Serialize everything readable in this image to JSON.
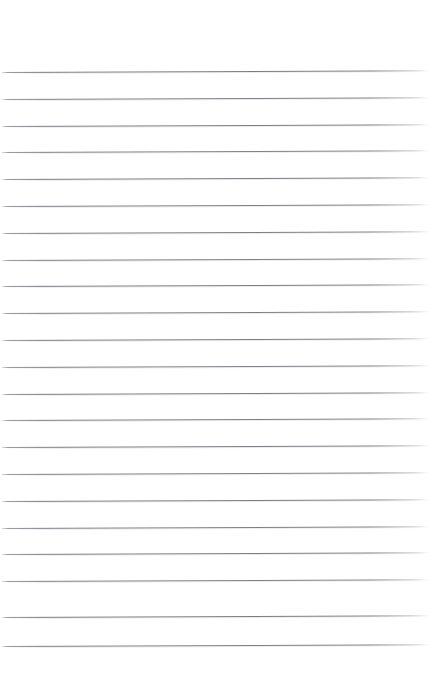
{
  "document": {
    "kind": "scanned-lined-paper",
    "title": "Blank Lined Notebook Page",
    "page_width": 438,
    "page_height": 688,
    "paper_color": "#ffffff",
    "rule_color": "#686a70",
    "written_text": "",
    "header_text": "",
    "footer_text": "",
    "page_number": "",
    "margin_rule": "none",
    "top_margin_px": 72,
    "bottom_margin_px": 41,
    "left_inset_px": 2,
    "right_inset_px": 7,
    "line_spacing_px": 26.8,
    "line_count": 22,
    "slant_deg": -0.22
  },
  "rules": [
    {
      "index": 1,
      "y": 72.0,
      "left": 2,
      "width": 429,
      "opacity": 0.95
    },
    {
      "index": 2,
      "y": 98.8,
      "left": 2,
      "width": 429,
      "opacity": 0.93
    },
    {
      "index": 3,
      "y": 125.6,
      "left": 2,
      "width": 429,
      "opacity": 0.94
    },
    {
      "index": 4,
      "y": 152.4,
      "left": 2,
      "width": 429,
      "opacity": 0.92
    },
    {
      "index": 5,
      "y": 179.2,
      "left": 2,
      "width": 429,
      "opacity": 0.95
    },
    {
      "index": 6,
      "y": 206.0,
      "left": 2,
      "width": 429,
      "opacity": 0.93
    },
    {
      "index": 7,
      "y": 232.8,
      "left": 2,
      "width": 429,
      "opacity": 0.94
    },
    {
      "index": 8,
      "y": 259.6,
      "left": 2,
      "width": 429,
      "opacity": 0.92
    },
    {
      "index": 9,
      "y": 286.4,
      "left": 2,
      "width": 429,
      "opacity": 0.95
    },
    {
      "index": 10,
      "y": 313.2,
      "left": 2,
      "width": 429,
      "opacity": 0.93
    },
    {
      "index": 11,
      "y": 340.0,
      "left": 2,
      "width": 429,
      "opacity": 0.94
    },
    {
      "index": 12,
      "y": 366.8,
      "left": 2,
      "width": 429,
      "opacity": 0.92
    },
    {
      "index": 13,
      "y": 393.6,
      "left": 2,
      "width": 429,
      "opacity": 0.95
    },
    {
      "index": 14,
      "y": 420.4,
      "left": 2,
      "width": 429,
      "opacity": 0.93
    },
    {
      "index": 15,
      "y": 447.2,
      "left": 2,
      "width": 429,
      "opacity": 0.94
    },
    {
      "index": 16,
      "y": 474.0,
      "left": 2,
      "width": 429,
      "opacity": 0.92
    },
    {
      "index": 17,
      "y": 500.8,
      "left": 2,
      "width": 429,
      "opacity": 0.95
    },
    {
      "index": 18,
      "y": 527.6,
      "left": 2,
      "width": 429,
      "opacity": 0.93
    },
    {
      "index": 19,
      "y": 554.4,
      "left": 2,
      "width": 429,
      "opacity": 0.94
    },
    {
      "index": 20,
      "y": 581.2,
      "left": 2,
      "width": 429,
      "opacity": 0.92
    },
    {
      "index": 21,
      "y": 617.0,
      "left": 2,
      "width": 429,
      "opacity": 0.95
    },
    {
      "index": 22,
      "y": 646.0,
      "left": 2,
      "width": 429,
      "opacity": 0.93
    }
  ]
}
